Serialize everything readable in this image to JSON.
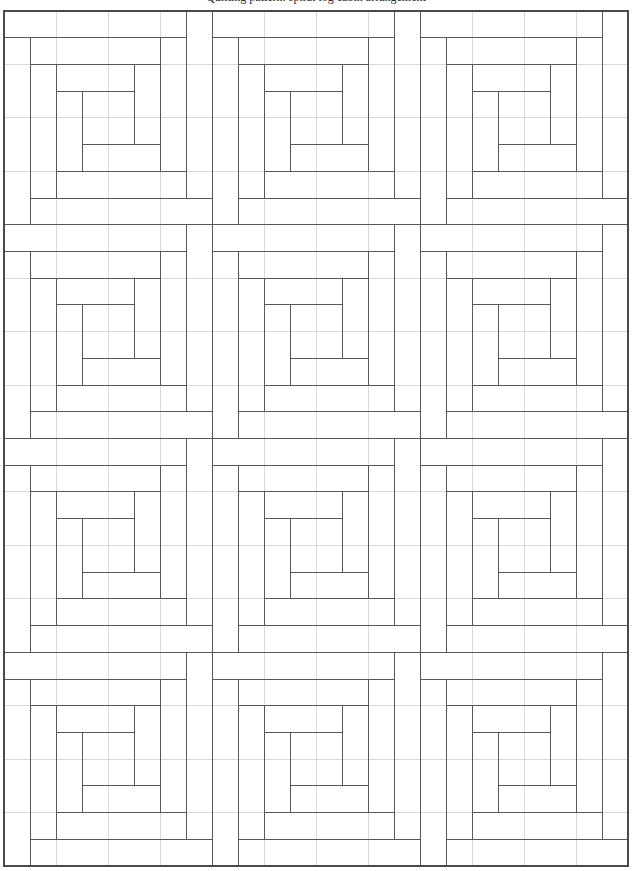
{
  "page": {
    "caption": "Quilting pattern: spiral log cabin arrangement",
    "background_color": "#ffffff",
    "width": 632,
    "height": 871
  },
  "figure": {
    "name": "spiral-log-cabin-quilt",
    "line_color": "#58585a",
    "grid_color": "#bfbfbf",
    "frame_color": "#4a4a4c",
    "block_columns": 3,
    "block_rows": 4,
    "block_count": 12,
    "cells_per_block": 8,
    "cell_width": 26,
    "cell_height": 26.72,
    "origin_x": 4,
    "origin_y": 11,
    "total_width": 624,
    "total_height": 855,
    "motif": "log-cabin-spiral",
    "spiral_rings": 4,
    "spiral_direction": "clockwise-inward"
  },
  "chart_data": {
    "type": "diagram",
    "grid": {
      "columns": 24,
      "rows": 32,
      "cell_size_x": 26,
      "cell_size_y": 26.72,
      "visible": true
    },
    "block": {
      "size_cells": 8,
      "rings": [
        {
          "ring": 0,
          "inset": 0,
          "span": 8
        },
        {
          "ring": 1,
          "inset": 1,
          "span": 6
        },
        {
          "ring": 2,
          "inset": 2,
          "span": 4
        },
        {
          "ring": 3,
          "inset": 3,
          "span": 2
        }
      ]
    },
    "legend": [],
    "xlabel": "",
    "ylabel": ""
  }
}
